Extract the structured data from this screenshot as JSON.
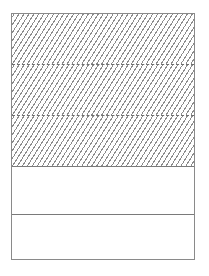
{
  "diagram": {
    "type": "stacked-rectangle",
    "bands": [
      {
        "index": 1,
        "fill": "hatched",
        "label": ""
      },
      {
        "index": 2,
        "fill": "hatched",
        "label": ""
      },
      {
        "index": 3,
        "fill": "hatched",
        "label": ""
      },
      {
        "index": 4,
        "fill": "empty",
        "label": ""
      },
      {
        "index": 5,
        "fill": "empty",
        "label": ""
      }
    ],
    "colors": {
      "stroke": "#8a8a8a",
      "hatch": "#8c8c8c",
      "background": "#ffffff"
    }
  }
}
